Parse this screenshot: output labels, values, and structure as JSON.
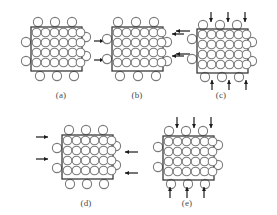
{
  "figure": {
    "caption_labels": [
      "(a)",
      "(b)",
      "(c)",
      "(d)",
      "(e)"
    ],
    "colors": {
      "box_stroke": "#3a3a3a",
      "circle_stroke": "#7a7a7a",
      "circle_fill": "#ffffff",
      "arrow_color": "#1a1a1a",
      "label_color": "#4a4a4a",
      "background": "#ffffff"
    },
    "grid": {
      "inner_columns": 6,
      "inner_rows": 4,
      "boundary_circles_top": 3,
      "boundary_circles_bottom": 3,
      "boundary_circles_left": 2,
      "boundary_circles_right": 2
    }
  },
  "panels": [
    {
      "id": "a",
      "label": "(a)",
      "description": "initial-state-uncompressed",
      "arrows": {
        "left": 0,
        "right": 2,
        "top": 0,
        "bottom": 0
      },
      "arrow_note": "two rightward arrows placed to the right of the panel"
    },
    {
      "id": "b",
      "label": "(b)",
      "description": "horizontal-compression-from-right",
      "arrows": {
        "left": 0,
        "right": 2,
        "top": 0,
        "bottom": 0
      },
      "arrow_note": "two leftward arrows entering from the right edge"
    },
    {
      "id": "c",
      "label": "(c)",
      "description": "vertical-and-left-compression",
      "arrows": {
        "left": 2,
        "right": 0,
        "top": 3,
        "bottom": 3
      },
      "arrow_note": "three downward arrows on top, three upward arrows on bottom, two leftward arrows on left"
    },
    {
      "id": "d",
      "label": "(d)",
      "description": "biaxial-horizontal-compression",
      "arrows": {
        "left": 2,
        "right": 3,
        "top": 0,
        "bottom": 0
      },
      "arrow_note": "rightward arrows on left edge, leftward arrows on right edge"
    },
    {
      "id": "e",
      "label": "(e)",
      "description": "biaxial-vertical-compression",
      "arrows": {
        "left": 0,
        "right": 0,
        "top": 3,
        "bottom": 3
      },
      "arrow_note": "three downward arrows on top, three upward arrows on bottom"
    }
  ]
}
